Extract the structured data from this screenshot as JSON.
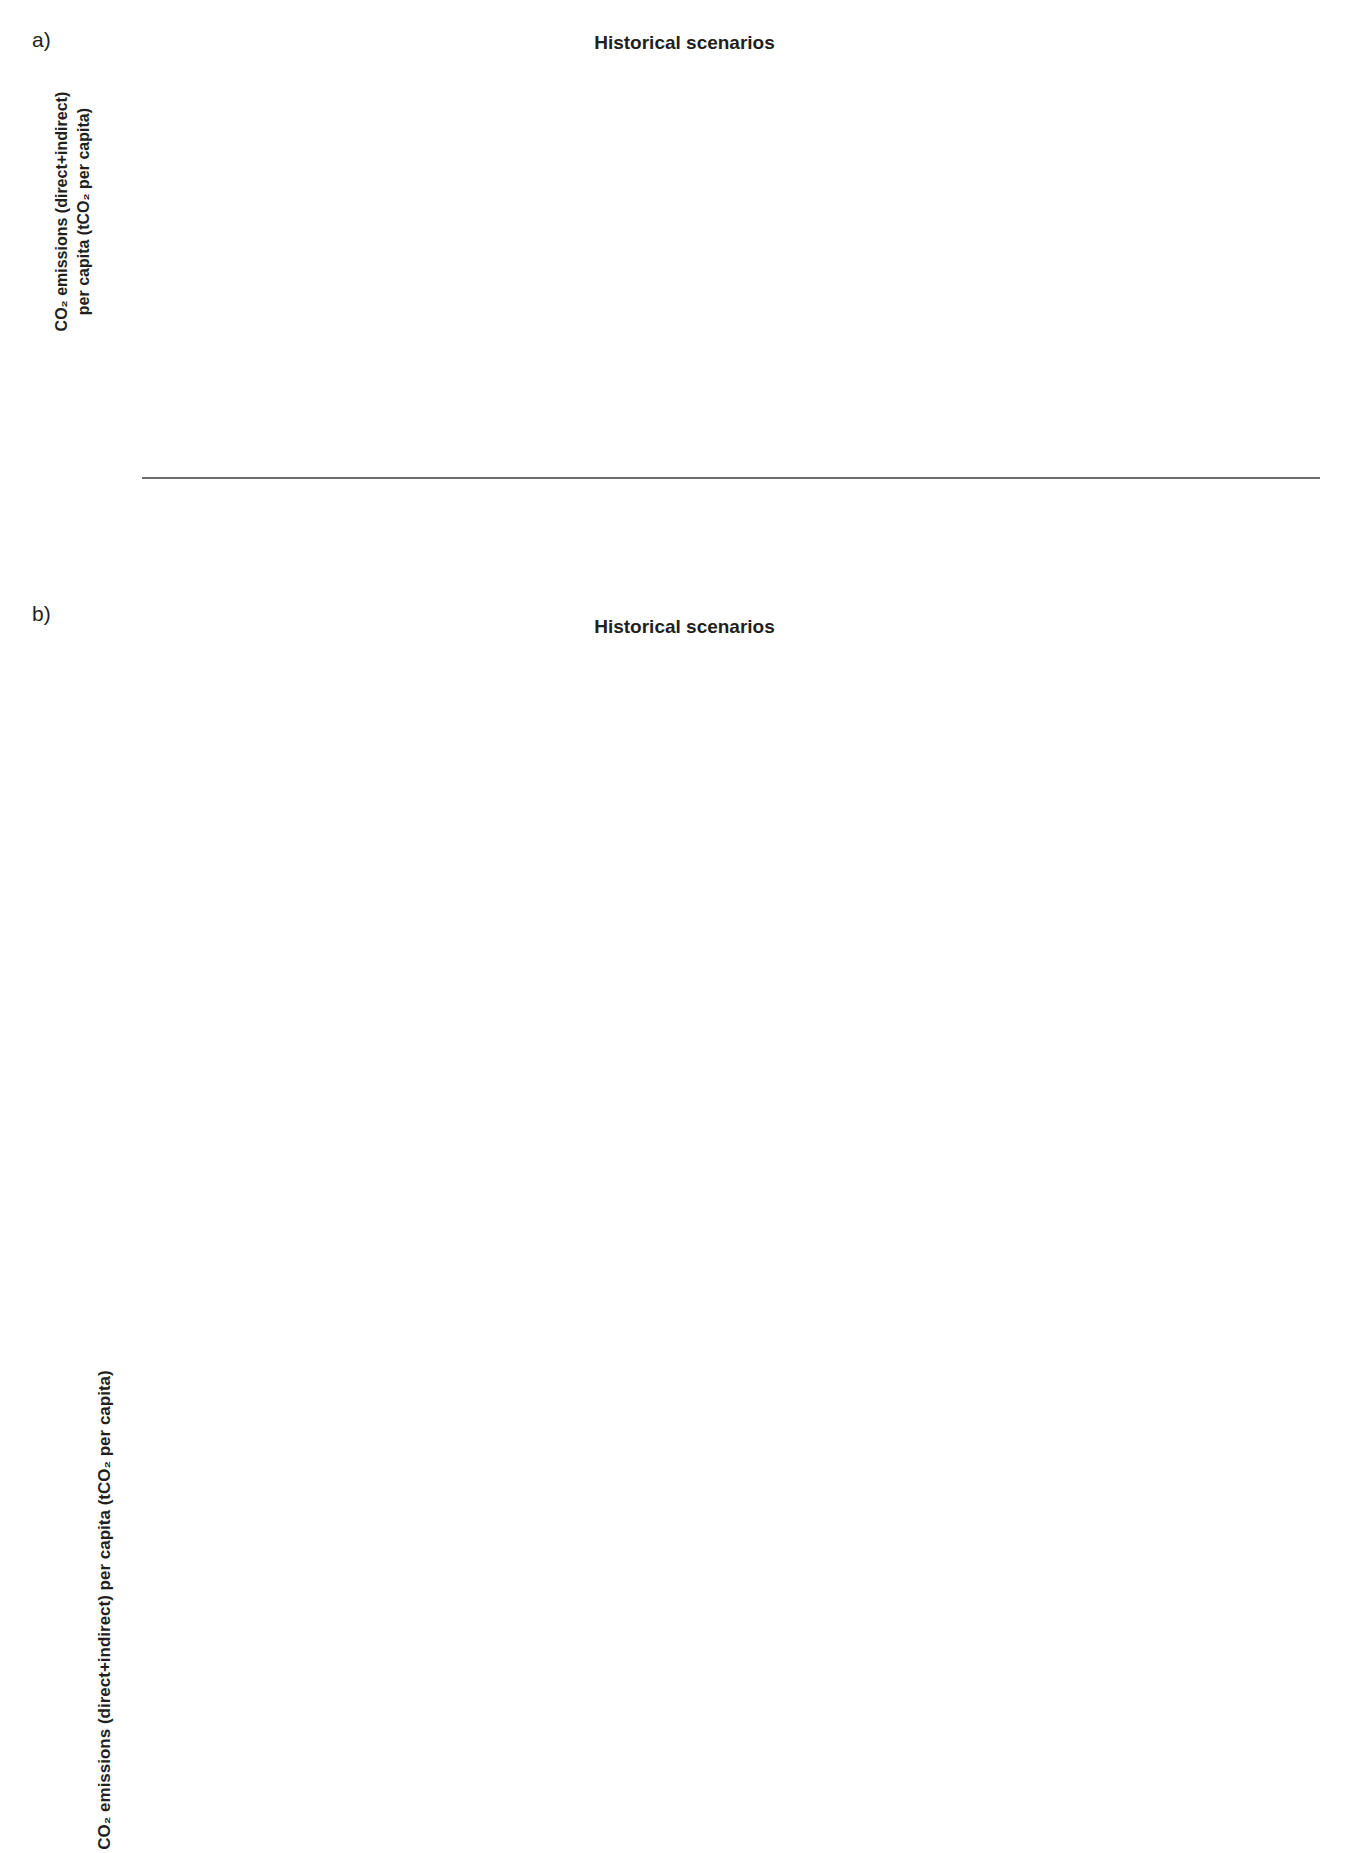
{
  "panel_a": {
    "letter": "a)",
    "title": "Historical scenarios",
    "ylabel_line1": "CO₂ emissions (direct+indirect)",
    "ylabel_line2": "per capita (tCO₂ per capita)",
    "yticks": [
      "0.0",
      "0.1",
      "0.2",
      "0.3",
      "0.4",
      "0.5",
      "0.6",
      "0.7",
      "0.8",
      "0.9",
      "1.0"
    ],
    "group_labels": [
      "Historical",
      "IEA Current\nPolicies Scenario\nIEA-WEO 2020",
      "IEA Sustainable and\nDevelopment Scenario\nIEA-WEO 2020",
      "IEA Net-zero\nEmissions Scenario\n(IEA-NZE 2021)",
      "IMAGE Lifestyle and\nRenewable scenario",
      "RECC LED and\n2°C policy"
    ]
  },
  "panel_b": {
    "letter": "b)",
    "title": "Historical scenarios",
    "ylabel": "CO₂ emissions (direct+indirect) per capita (tCO₂ per capita)"
  },
  "legend": {
    "items": [
      {
        "label": "Historical",
        "color": "#7a7a78"
      },
      {
        "label": "IEA Current Policies Scenario\nIEA-WEO 2020",
        "color": "#5b9bd5"
      },
      {
        "label": "IEA Sustainable and Development\nScenario IEA-WEO 2020",
        "color": "#f5ad2e"
      },
      {
        "label": "IMAGE Lifestyle and\nRenewable Scenario",
        "color": "#17244c"
      },
      {
        "label": "RECC LED and 2°C policy",
        "color": "#d9512c"
      }
    ]
  },
  "colors": {
    "historical": "#7a7a78",
    "iea_cps": "#5b9bd5",
    "iea_sds": "#f5ad2e",
    "iea_nze": "#cfcfcf",
    "image_lr": "#17244c",
    "recc_led": "#d9512c",
    "grid": "#c9c9c9",
    "axis": "#6d6d6d",
    "text": "#231f20"
  },
  "chart_data": [
    {
      "id": "panel_a",
      "type": "bar",
      "title": "Historical scenarios",
      "xlabel": "",
      "ylabel": "CO2 emissions (direct+indirect) per capita (tCO2 per capita)",
      "ylim": [
        0.0,
        1.0
      ],
      "ytick_step": 0.1,
      "grid": true,
      "legend_position": "bottom",
      "categories": [
        "1990",
        "2000",
        "2010",
        "2019",
        "2020",
        "2030",
        "2040",
        "2050",
        "2020",
        "2030",
        "2040",
        "2050",
        "2020",
        "2030",
        "2040",
        "2050",
        "2020",
        "2030",
        "2040",
        "2050",
        "2020",
        "2030",
        "2040",
        "2050"
      ],
      "groups": [
        {
          "name": "Historical",
          "scenario_key": "historical",
          "years": [
            "1990",
            "2000",
            "2010",
            "2019"
          ],
          "values": [
            0.755,
            0.74,
            0.775,
            0.762
          ],
          "markers": [
            "none",
            "down",
            "up",
            "down"
          ]
        },
        {
          "name": "IEA Current Policies Scenario IEA-WEO 2020",
          "scenario_key": "iea_cps",
          "years": [
            "2020",
            "2030",
            "2040",
            "2050"
          ],
          "values": [
            0.733,
            0.766,
            0.822,
            0.88
          ],
          "markers": [
            "none",
            "up",
            "up",
            "up"
          ]
        },
        {
          "name": "IEA Sustainable and Development Scenario IEA-WEO 2020",
          "scenario_key": "iea_sds",
          "years": [
            "2020",
            "2030",
            "2040",
            "2050"
          ],
          "values": [
            0.733,
            0.494,
            0.262,
            0.131
          ],
          "markers": [
            "none",
            "down",
            "down",
            "down"
          ]
        },
        {
          "name": "IEA Net-zero Emissions Scenario (IEA-NZE 2021)",
          "scenario_key": "iea_nze",
          "years": [
            "2020",
            "2030",
            "2040",
            "2050"
          ],
          "values": [
            0.733,
            0.316,
            0.056,
            0.006
          ],
          "markers": [
            "none",
            "down",
            "down",
            "down"
          ]
        },
        {
          "name": "IMAGE Lifestyle and Renewable scenario",
          "scenario_key": "image_lr",
          "years": [
            "2020",
            "2030",
            "2040",
            "2050"
          ],
          "values": [
            0.64,
            0.547,
            0.344,
            0.213
          ],
          "markers": [
            "none",
            "down",
            "down",
            "down"
          ]
        },
        {
          "name": "RECC LED and 2°C policy",
          "scenario_key": "recc_led",
          "years": [
            "2020",
            "2030",
            "2040",
            "2050"
          ],
          "values": [
            0.685,
            0.293,
            0.111,
            0.057
          ],
          "markers": [
            "none",
            "down",
            "down",
            "down"
          ]
        }
      ]
    },
    {
      "id": "africa",
      "type": "bar",
      "title": "Africa",
      "ylim": [
        0.0,
        0.4
      ],
      "ytick_step": 0.1,
      "yticks": [
        "0.0",
        "0.1",
        "0.2",
        "0.3",
        "0.4"
      ],
      "values": [
        0.156,
        0.166,
        0.205,
        0.218,
        0.228,
        0.268,
        0.36,
        0.204,
        0.15,
        0.113,
        0.11,
        0.152,
        0.121,
        0.089,
        0.057,
        0.209,
        0.09,
        0.034,
        0.02
      ],
      "markers": [
        "none",
        "up",
        "up",
        "up",
        "up",
        "up",
        "up",
        "none",
        "down",
        "down",
        "down",
        "none",
        "down",
        "down",
        "down",
        "none",
        "down",
        "down",
        "down"
      ],
      "series_keys": [
        "historical",
        "historical",
        "historical",
        "historical",
        "iea_cps",
        "iea_cps",
        "iea_cps",
        "iea_sds",
        "iea_sds",
        "iea_sds",
        "iea_sds",
        "image_lr",
        "image_lr",
        "image_lr",
        "image_lr",
        "recc_led",
        "recc_led",
        "recc_led",
        "recc_led"
      ]
    },
    {
      "id": "australia_japan_nz",
      "type": "bar",
      "title": "Australia, Japan and New Zealand",
      "ylim": [
        0.0,
        2.0
      ],
      "ytick_step": 0.2,
      "yticks": [
        "0.0",
        "0.2",
        "0.4",
        "0.6",
        "0.8",
        "1.0",
        "1.2",
        "1.4",
        "1.6",
        "1.8",
        "2.0"
      ],
      "values": [
        1.33,
        1.51,
        1.69,
        1.52,
        1.45,
        1.43,
        1.41,
        1.31,
        1.45,
        1.16,
        0.77,
        0.36,
        0.1,
        1.25,
        0.96,
        0.45,
        0.28,
        0.8,
        0.28,
        0.08,
        0.03
      ],
      "markers": [
        "none",
        "up",
        "up",
        "down",
        "none",
        "down",
        "down",
        "down",
        "none",
        "down",
        "down",
        "down",
        "down",
        "none",
        "down",
        "down",
        "down",
        "none",
        "down",
        "down",
        "down"
      ],
      "series_keys": [
        "historical",
        "historical",
        "historical",
        "historical",
        "iea_cps",
        "iea_cps",
        "iea_cps",
        "iea_cps",
        "iea_sds",
        "iea_sds",
        "iea_sds",
        "iea_sds",
        "iea_sds",
        "image_lr",
        "image_lr",
        "image_lr",
        "image_lr",
        "recc_led",
        "recc_led",
        "recc_led",
        "recc_led"
      ]
    },
    {
      "id": "eastern_asia",
      "type": "bar",
      "title": "Eastern Asia",
      "ylim": [
        0.0,
        1.6
      ],
      "ytick_step": 0.2,
      "yticks": [
        "0.0",
        "0.2",
        "0.4",
        "0.6",
        "0.8",
        "1.0",
        "1.2",
        "1.4",
        "1.6"
      ],
      "values": [
        0.38,
        0.39,
        0.72,
        1.11,
        1.03,
        1.21,
        1.27,
        1.29,
        1.03,
        0.81,
        0.38,
        0.14,
        0.84,
        0.89,
        0.41,
        0.25,
        0.86,
        0.33,
        0.16,
        0.09
      ],
      "markers": [
        "none",
        "up",
        "up",
        "up",
        "none",
        "up",
        "up",
        "up",
        "none",
        "down",
        "down",
        "down",
        "none",
        "up",
        "down",
        "down",
        "none",
        "down",
        "down",
        "down"
      ],
      "series_keys": [
        "historical",
        "historical",
        "historical",
        "historical",
        "iea_cps",
        "iea_cps",
        "iea_cps",
        "iea_cps",
        "iea_sds",
        "iea_sds",
        "iea_sds",
        "iea_sds",
        "image_lr",
        "image_lr",
        "image_lr",
        "image_lr",
        "recc_led",
        "recc_led",
        "recc_led",
        "recc_led"
      ]
    },
    {
      "id": "europe_eurasia",
      "type": "bar",
      "title": "Europe and Eurasia",
      "ylim": [
        0.0,
        2.5
      ],
      "ytick_step": 0.5,
      "yticks": [
        "0.0",
        "0.5",
        "1.0",
        "1.5",
        "2.0",
        "2.5"
      ],
      "values": [
        2.09,
        1.9,
        1.76,
        1.46,
        1.42,
        1.38,
        1.36,
        1.34,
        1.42,
        0.99,
        0.63,
        0.32,
        1.52,
        1.31,
        0.98,
        0.68,
        1.8,
        1.02,
        0.48,
        0.28
      ],
      "markers": [
        "none",
        "down",
        "down",
        "down",
        "none",
        "down",
        "down",
        "down",
        "none",
        "down",
        "down",
        "down",
        "none",
        "down",
        "down",
        "down",
        "none",
        "down",
        "down",
        "down"
      ],
      "series_keys": [
        "historical",
        "historical",
        "historical",
        "historical",
        "iea_cps",
        "iea_cps",
        "iea_cps",
        "iea_cps",
        "iea_sds",
        "iea_sds",
        "iea_sds",
        "iea_sds",
        "image_lr",
        "image_lr",
        "image_lr",
        "image_lr",
        "recc_led",
        "recc_led",
        "recc_led",
        "recc_led"
      ]
    },
    {
      "id": "latin_america_caribbean",
      "type": "bar",
      "title": "Latin America and Caribbean",
      "ylim": [
        0.0,
        0.5
      ],
      "ytick_step": 0.1,
      "yticks": [
        "0.0",
        "0.1",
        "0.2",
        "0.3",
        "0.4",
        "0.5"
      ],
      "values": [
        0.287,
        0.305,
        0.345,
        0.34,
        0.36,
        0.385,
        0.432,
        0.317,
        0.222,
        0.141,
        0.077,
        0.281,
        0.228,
        0.163,
        0.148,
        0.338,
        0.107,
        0.048,
        0.027
      ],
      "markers": [
        "none",
        "up",
        "up",
        "up",
        "up",
        "up",
        "up",
        "none",
        "down",
        "down",
        "down",
        "none",
        "down",
        "down",
        "down",
        "none",
        "down",
        "down",
        "down"
      ],
      "series_keys": [
        "historical",
        "historical",
        "historical",
        "historical",
        "iea_cps",
        "iea_cps",
        "iea_cps",
        "iea_sds",
        "iea_sds",
        "iea_sds",
        "iea_sds",
        "image_lr",
        "image_lr",
        "image_lr",
        "image_lr",
        "recc_led",
        "recc_led",
        "recc_led",
        "recc_led"
      ]
    },
    {
      "id": "middle_east",
      "type": "bar",
      "title": "Middle East",
      "ylim": [
        0.0,
        2.5
      ],
      "ytick_step": 0.5,
      "yticks": [
        "0.0",
        "0.5",
        "1.0",
        "1.5",
        "2.0",
        "2.5"
      ],
      "values": [
        0.89,
        1.33,
        1.76,
        1.74,
        1.73,
        1.67,
        1.76,
        1.86,
        1.53,
        1.2,
        0.76,
        0.43,
        1.25,
        0.96,
        0.82,
        0.79,
        0.8,
        0.54,
        0.36,
        0.09,
        0.06
      ],
      "markers": [
        "none",
        "up",
        "up",
        "up",
        "up",
        "up",
        "up",
        "up",
        "none",
        "down",
        "down",
        "down",
        "none",
        "down",
        "down",
        "down",
        "none",
        "down",
        "down",
        "down",
        "down"
      ],
      "series_keys": [
        "historical",
        "historical",
        "historical",
        "historical",
        "iea_cps",
        "iea_cps",
        "iea_cps",
        "iea_cps",
        "iea_sds",
        "iea_sds",
        "iea_sds",
        "iea_sds",
        "image_lr",
        "image_lr",
        "image_lr",
        "image_lr",
        "recc_led",
        "recc_led",
        "recc_led",
        "recc_led"
      ]
    },
    {
      "id": "north_america",
      "type": "bar",
      "title": "North America",
      "ylim": [
        0.0,
        1.6
      ],
      "ytick_step": 0.2,
      "yticks": [
        "0.0",
        "0.2",
        "0.4",
        "0.6",
        "0.8",
        "1.0",
        "1.2",
        "1.4",
        "1.6"
      ],
      "values": [
        0.55,
        0.66,
        1.03,
        1.0,
        0.86,
        1.13,
        1.27,
        1.43,
        0.99,
        0.91,
        0.68,
        0.42,
        0.31,
        0.31,
        0.31,
        0.19,
        0.08,
        0.03,
        0.02
      ],
      "markers": [
        "none",
        "up",
        "up",
        "down",
        "none",
        "up",
        "up",
        "up",
        "none",
        "down",
        "down",
        "down",
        "up",
        "up",
        "down",
        "none",
        "down",
        "down",
        "down"
      ],
      "series_keys": [
        "historical",
        "historical",
        "historical",
        "historical",
        "iea_cps",
        "iea_cps",
        "iea_cps",
        "iea_cps",
        "iea_sds",
        "iea_sds",
        "iea_sds",
        "iea_sds",
        "image_lr",
        "image_lr",
        "image_lr",
        "recc_led",
        "recc_led",
        "recc_led",
        "recc_led"
      ]
    },
    {
      "id": "south_east_asia_pacific",
      "type": "bar",
      "title": "South East Asia and Pacific",
      "ylim": [
        0.0,
        1.0
      ],
      "ytick_step": 0.1,
      "yticks": [
        "0.0",
        "0.1",
        "0.2",
        "0.3",
        "0.4",
        "0.5",
        "0.6",
        "0.7",
        "0.8",
        "0.9",
        "1.0"
      ],
      "values": [
        0.175,
        0.232,
        0.255,
        0.335,
        0.33,
        0.455,
        0.61,
        0.825,
        0.335,
        0.285,
        0.185,
        0.125,
        0.215,
        0.2,
        0.115,
        0.053,
        0.13,
        0.098,
        0.04,
        0.022
      ],
      "markers": [
        "none",
        "up",
        "up",
        "up",
        "none",
        "up",
        "up",
        "up",
        "none",
        "down",
        "down",
        "down",
        "none",
        "down",
        "down",
        "down",
        "none",
        "down",
        "down",
        "down"
      ],
      "series_keys": [
        "historical",
        "historical",
        "historical",
        "historical",
        "iea_cps",
        "iea_cps",
        "iea_cps",
        "iea_cps",
        "iea_sds",
        "iea_sds",
        "iea_sds",
        "iea_sds",
        "image_lr",
        "image_lr",
        "image_lr",
        "image_lr",
        "recc_led",
        "recc_led",
        "recc_led",
        "recc_led"
      ]
    },
    {
      "id": "southern_asia",
      "type": "bar",
      "title": "Southern Asia",
      "ylim": [
        0.0,
        1.2
      ],
      "ytick_step": 0.2,
      "yticks": [
        "0.0",
        "0.2",
        "0.4",
        "0.6",
        "0.8",
        "1.0",
        "1.2"
      ],
      "values": [
        0.1,
        0.165,
        0.2,
        0.29,
        0.285,
        0.465,
        0.725,
        0.915,
        0.27,
        0.255,
        0.16,
        0.065,
        0.205,
        0.21,
        0.22,
        0.145,
        0.275,
        0.125,
        0.04,
        0.02
      ],
      "markers": [
        "none",
        "up",
        "up",
        "up",
        "none",
        "up",
        "up",
        "up",
        "none",
        "down",
        "down",
        "down",
        "none",
        "up",
        "up",
        "down",
        "none",
        "down",
        "down",
        "down"
      ],
      "series_keys": [
        "historical",
        "historical",
        "historical",
        "historical",
        "iea_cps",
        "iea_cps",
        "iea_cps",
        "iea_cps",
        "iea_sds",
        "iea_sds",
        "iea_sds",
        "iea_sds",
        "image_lr",
        "image_lr",
        "image_lr",
        "image_lr",
        "recc_led",
        "recc_led",
        "recc_led",
        "recc_led"
      ]
    }
  ],
  "xaxis_years": [
    "1990",
    "2000",
    "2010",
    "2019",
    "2020",
    "2030",
    "2040",
    "2050",
    "2020",
    "2030",
    "2040",
    "2050",
    "2020",
    "2030",
    "2040",
    "2050",
    "2020",
    "2030",
    "2040",
    "2050"
  ]
}
